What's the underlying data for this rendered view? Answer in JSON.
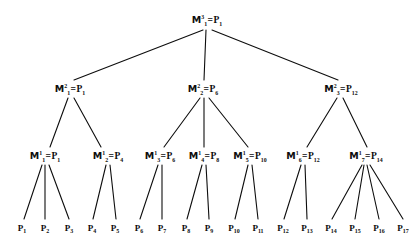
{
  "figure": {
    "type": "tree-diagram",
    "title": "",
    "background_color": "#ffffff",
    "ink_color": "#0d0d0d",
    "width": 418,
    "height": 245
  },
  "nodes": {
    "root": {
      "id": "M1_3",
      "m_letter": "M",
      "superscript": "3",
      "subscript": "1",
      "equals": "=",
      "p_letter": "P",
      "p_subscript": "1",
      "label": "M13 = P1",
      "x": 207,
      "y": 20
    },
    "level2": [
      {
        "id": "M1_2",
        "m_letter": "M",
        "superscript": "2",
        "subscript": "1",
        "equals": "=",
        "p_letter": "P",
        "p_subscript": "1",
        "x": 70,
        "y": 89
      },
      {
        "id": "M2_2",
        "m_letter": "M",
        "superscript": "2",
        "subscript": "2",
        "equals": "=",
        "p_letter": "P",
        "p_subscript": "6",
        "x": 203,
        "y": 89
      },
      {
        "id": "M3_2",
        "m_letter": "M",
        "superscript": "2",
        "subscript": "3",
        "equals": "=",
        "p_letter": "P",
        "p_subscript": "12",
        "x": 341,
        "y": 89
      }
    ],
    "level1": [
      {
        "id": "M1_1",
        "m_letter": "M",
        "superscript": "1",
        "subscript": "1",
        "equals": "=",
        "p_letter": "P",
        "p_subscript": "1",
        "x": 45,
        "y": 156
      },
      {
        "id": "M2_1",
        "m_letter": "M",
        "superscript": "1",
        "subscript": "2",
        "equals": "=",
        "p_letter": "P",
        "p_subscript": "4",
        "x": 108,
        "y": 156
      },
      {
        "id": "M3_1",
        "m_letter": "M",
        "superscript": "1",
        "subscript": "3",
        "equals": "=",
        "p_letter": "P",
        "p_subscript": "6",
        "x": 160,
        "y": 156
      },
      {
        "id": "M4_1",
        "m_letter": "M",
        "superscript": "1",
        "subscript": "4",
        "equals": "=",
        "p_letter": "P",
        "p_subscript": "8",
        "x": 204,
        "y": 156
      },
      {
        "id": "M5_1",
        "m_letter": "M",
        "superscript": "1",
        "subscript": "5",
        "equals": "=",
        "p_letter": "P",
        "p_subscript": "10",
        "x": 250,
        "y": 156
      },
      {
        "id": "M6_1",
        "m_letter": "M",
        "superscript": "1",
        "subscript": "6",
        "equals": "=",
        "p_letter": "P",
        "p_subscript": "12",
        "x": 303,
        "y": 156
      },
      {
        "id": "M7_1",
        "m_letter": "M",
        "superscript": "1",
        "subscript": "7",
        "equals": "=",
        "p_letter": "P",
        "p_subscript": "14",
        "x": 366,
        "y": 156
      }
    ],
    "leaves": [
      {
        "id": "P1",
        "p_letter": "P",
        "p_subscript": "1",
        "x": 22,
        "y": 228
      },
      {
        "id": "P2",
        "p_letter": "P",
        "p_subscript": "2",
        "x": 45,
        "y": 228
      },
      {
        "id": "P3",
        "p_letter": "P",
        "p_subscript": "3",
        "x": 69,
        "y": 228
      },
      {
        "id": "P4",
        "p_letter": "P",
        "p_subscript": "4",
        "x": 92,
        "y": 228
      },
      {
        "id": "P5",
        "p_letter": "P",
        "p_subscript": "5",
        "x": 115,
        "y": 228
      },
      {
        "id": "P6",
        "p_letter": "P",
        "p_subscript": "6",
        "x": 139,
        "y": 228
      },
      {
        "id": "P7",
        "p_letter": "P",
        "p_subscript": "7",
        "x": 162,
        "y": 228
      },
      {
        "id": "P8",
        "p_letter": "P",
        "p_subscript": "8",
        "x": 186,
        "y": 228
      },
      {
        "id": "P9",
        "p_letter": "P",
        "p_subscript": "9",
        "x": 209,
        "y": 228
      },
      {
        "id": "P10",
        "p_letter": "P",
        "p_subscript": "10",
        "x": 234,
        "y": 228
      },
      {
        "id": "P11",
        "p_letter": "P",
        "p_subscript": "11",
        "x": 258,
        "y": 228
      },
      {
        "id": "P12",
        "p_letter": "P",
        "p_subscript": "12",
        "x": 283,
        "y": 228
      },
      {
        "id": "P13",
        "p_letter": "P",
        "p_subscript": "13",
        "x": 307,
        "y": 228
      },
      {
        "id": "P14",
        "p_letter": "P",
        "p_subscript": "14",
        "x": 331,
        "y": 228
      },
      {
        "id": "P15",
        "p_letter": "P",
        "p_subscript": "15",
        "x": 355,
        "y": 228
      },
      {
        "id": "P16",
        "p_letter": "P",
        "p_subscript": "16",
        "x": 379,
        "y": 228
      },
      {
        "id": "P17",
        "p_letter": "P",
        "p_subscript": "17",
        "x": 403,
        "y": 228
      }
    ]
  },
  "edges": [
    {
      "from": "M1_3",
      "to": "M1_2",
      "x1": 203,
      "y1": 30,
      "x2": 74,
      "y2": 80
    },
    {
      "from": "M1_3",
      "to": "M2_2",
      "x1": 206,
      "y1": 30,
      "x2": 204,
      "y2": 80
    },
    {
      "from": "M1_3",
      "to": "M3_2",
      "x1": 212,
      "y1": 30,
      "x2": 338,
      "y2": 80
    },
    {
      "from": "M1_2",
      "to": "M1_1",
      "x1": 68,
      "y1": 98,
      "x2": 50,
      "y2": 147
    },
    {
      "from": "M1_2",
      "to": "M2_1",
      "x1": 74,
      "y1": 98,
      "x2": 101,
      "y2": 147
    },
    {
      "from": "M2_2",
      "to": "M3_1",
      "x1": 200,
      "y1": 98,
      "x2": 164,
      "y2": 147
    },
    {
      "from": "M2_2",
      "to": "M4_1",
      "x1": 204,
      "y1": 98,
      "x2": 204,
      "y2": 147
    },
    {
      "from": "M2_2",
      "to": "M5_1",
      "x1": 209,
      "y1": 98,
      "x2": 248,
      "y2": 147
    },
    {
      "from": "M3_2",
      "to": "M6_1",
      "x1": 337,
      "y1": 98,
      "x2": 307,
      "y2": 147
    },
    {
      "from": "M3_2",
      "to": "M7_1",
      "x1": 343,
      "y1": 98,
      "x2": 367,
      "y2": 147
    },
    {
      "from": "M1_1",
      "to": "P1",
      "x1": 42,
      "y1": 165,
      "x2": 24,
      "y2": 219
    },
    {
      "from": "M1_1",
      "to": "P2",
      "x1": 45,
      "y1": 165,
      "x2": 45,
      "y2": 219
    },
    {
      "from": "M1_1",
      "to": "P3",
      "x1": 49,
      "y1": 165,
      "x2": 69,
      "y2": 219
    },
    {
      "from": "M2_1",
      "to": "P4",
      "x1": 106,
      "y1": 165,
      "x2": 93,
      "y2": 219
    },
    {
      "from": "M2_1",
      "to": "P5",
      "x1": 110,
      "y1": 165,
      "x2": 116,
      "y2": 219
    },
    {
      "from": "M3_1",
      "to": "P6",
      "x1": 158,
      "y1": 165,
      "x2": 140,
      "y2": 219
    },
    {
      "from": "M3_1",
      "to": "P7",
      "x1": 162,
      "y1": 165,
      "x2": 162,
      "y2": 219
    },
    {
      "from": "M4_1",
      "to": "P8",
      "x1": 202,
      "y1": 165,
      "x2": 187,
      "y2": 219
    },
    {
      "from": "M4_1",
      "to": "P9",
      "x1": 206,
      "y1": 165,
      "x2": 209,
      "y2": 219
    },
    {
      "from": "M5_1",
      "to": "P10",
      "x1": 248,
      "y1": 165,
      "x2": 235,
      "y2": 219
    },
    {
      "from": "M5_1",
      "to": "P11",
      "x1": 252,
      "y1": 165,
      "x2": 258,
      "y2": 219
    },
    {
      "from": "M6_1",
      "to": "P12",
      "x1": 301,
      "y1": 165,
      "x2": 284,
      "y2": 219
    },
    {
      "from": "M6_1",
      "to": "P13",
      "x1": 305,
      "y1": 165,
      "x2": 307,
      "y2": 219
    },
    {
      "from": "M7_1",
      "to": "P14",
      "x1": 362,
      "y1": 165,
      "x2": 332,
      "y2": 219
    },
    {
      "from": "M7_1",
      "to": "P15",
      "x1": 364,
      "y1": 165,
      "x2": 355,
      "y2": 219
    },
    {
      "from": "M7_1",
      "to": "P16",
      "x1": 367,
      "y1": 165,
      "x2": 379,
      "y2": 219
    },
    {
      "from": "M7_1",
      "to": "P17",
      "x1": 370,
      "y1": 165,
      "x2": 403,
      "y2": 219
    }
  ]
}
